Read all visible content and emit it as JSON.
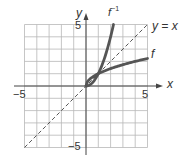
{
  "chart_data": {
    "type": "line",
    "title": "",
    "xlabel": "x",
    "ylabel": "y",
    "xlim": [
      -5,
      5
    ],
    "ylim": [
      -5,
      5
    ],
    "grid": true,
    "x_ticks": [
      -5,
      5
    ],
    "y_ticks": [
      -5,
      5
    ],
    "tick_labels": {
      "x_min": "−5",
      "x_max": "5",
      "y_min": "−5",
      "y_max": "5"
    },
    "series": [
      {
        "name": "f",
        "label": "f",
        "style": "thick solid",
        "points": [
          [
            0,
            0
          ],
          [
            0.25,
            0.5
          ],
          [
            1,
            1
          ],
          [
            2,
            1.41
          ],
          [
            3,
            1.73
          ],
          [
            4,
            2
          ],
          [
            5,
            2.24
          ]
        ]
      },
      {
        "name": "f^-1",
        "label": "f⁻¹",
        "style": "thick solid",
        "points": [
          [
            0,
            0
          ],
          [
            0.5,
            0.25
          ],
          [
            1,
            1
          ],
          [
            1.5,
            2.25
          ],
          [
            2,
            4
          ],
          [
            2.24,
            5
          ]
        ]
      },
      {
        "name": "y = x",
        "label": "y = x",
        "style": "dashed",
        "points": [
          [
            -5,
            -5
          ],
          [
            5,
            5
          ]
        ]
      }
    ],
    "annotations": [
      "f⁻¹",
      "y = x",
      "f"
    ]
  },
  "labels": {
    "x_axis": "x",
    "y_axis": "y",
    "x_min": "−5",
    "x_max": "5",
    "y_min": "−5",
    "y_max": "5",
    "f": "f",
    "finv_base": "f",
    "finv_sup": "−1",
    "yx": "y = x"
  }
}
